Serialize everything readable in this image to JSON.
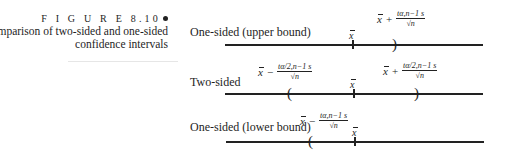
{
  "caption": {
    "figure_label": "F I G U R E  8.10",
    "title_line1": "Comparison of two-sided and one-sided",
    "title_line2": "confidence intervals"
  },
  "rows": [
    {
      "label": "One-sided (upper bound)",
      "center_symbol": "x̄",
      "upper_expr": {
        "x": "x",
        "op": "+",
        "num": "tα,n−1 s",
        "den": "√n"
      },
      "paren_right": ")"
    },
    {
      "label": "Two-sided",
      "center_symbol": "x̄",
      "lower_expr": {
        "x": "x",
        "op": "−",
        "num": "tα/2,n−1 s",
        "den": "√n"
      },
      "upper_expr": {
        "x": "x",
        "op": "+",
        "num": "tα/2,n−1 s",
        "den": "√n"
      },
      "paren_left": "(",
      "paren_right": ")"
    },
    {
      "label": "One-sided (lower bound)",
      "center_symbol": "x̄",
      "lower_expr": {
        "x": "x",
        "op": "−",
        "num": "tα,n−1 s",
        "den": "√n"
      },
      "paren_left": "("
    }
  ],
  "colors": {
    "ink": "#1e1e1e",
    "background": "#ffffff"
  }
}
